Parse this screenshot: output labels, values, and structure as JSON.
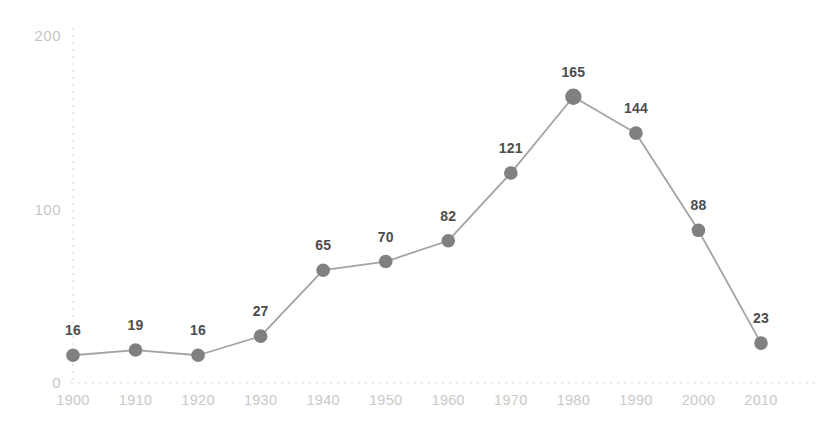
{
  "chart_data": {
    "type": "line",
    "title": "",
    "subtitle": "",
    "xlabel": "",
    "ylabel": "",
    "categories": [
      "1900",
      "1910",
      "1920",
      "1930",
      "1940",
      "1950",
      "1960",
      "1970",
      "1980",
      "1990",
      "2000",
      "2010"
    ],
    "values": [
      16,
      19,
      16,
      27,
      65,
      70,
      82,
      121,
      165,
      144,
      88,
      23
    ],
    "point_labels": [
      "16",
      "19",
      "16",
      "27",
      "65",
      "70",
      "82",
      "121",
      "165",
      "144",
      "88",
      "23"
    ],
    "x": [
      1900,
      1910,
      1920,
      1930,
      1940,
      1950,
      1960,
      1970,
      1980,
      1990,
      2000,
      2010
    ],
    "ylim": [
      0,
      200
    ],
    "xlim": [
      1900,
      2010
    ],
    "y_ticks": [
      "0",
      "100",
      "200"
    ],
    "y_tick_values": [
      0,
      100,
      200
    ],
    "x_ticks": [
      "1900",
      "1910",
      "1920",
      "1930",
      "1940",
      "1950",
      "1960",
      "1970",
      "1980",
      "1990",
      "2000",
      "2010"
    ],
    "grid": "dashed-axis-lines-only",
    "legend": "none",
    "series": [
      {
        "name": "",
        "values": [
          16,
          19,
          16,
          27,
          65,
          70,
          82,
          121,
          165,
          144,
          88,
          23
        ]
      }
    ],
    "colors": {
      "line": "#a3a3a3",
      "marker": "#808080",
      "point_label": "#4d4d4d",
      "tick_label": "#c8c8c8",
      "axis_line": "#e3e3e3",
      "background": "#ffffff"
    },
    "max_point": {
      "category": "1980",
      "value": 165
    },
    "min_point": {
      "category": "1900",
      "value": 16
    }
  }
}
